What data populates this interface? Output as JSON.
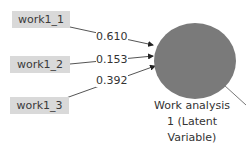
{
  "indicators": [
    {
      "label": "work1_1",
      "weight": "0.610"
    },
    {
      "label": "work1_2",
      "weight": "0.153"
    },
    {
      "label": "work1_3",
      "weight": "0.392"
    }
  ],
  "latent": {
    "label_line1": "Work analysis",
    "label_line2": "1 (Latent",
    "label_line3": "Variable)",
    "fill": "#7a7a7a"
  }
}
